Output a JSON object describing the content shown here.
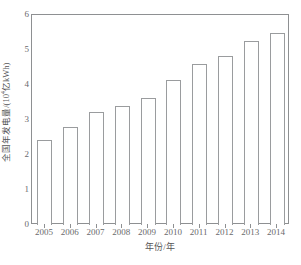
{
  "chart_data": {
    "type": "bar",
    "title": "",
    "subtitle": "",
    "xlabel": "年份/年",
    "ylabel": "全国年发电量/(10⁴亿kWh)",
    "ylabel_main": "全国年发电量/(10",
    "ylabel_sup": "4",
    "ylabel_tail": "亿kWh)",
    "categories": [
      "2005",
      "2006",
      "2007",
      "2008",
      "2009",
      "2010",
      "2011",
      "2012",
      "2013",
      "2014"
    ],
    "values": [
      2.43,
      2.8,
      3.22,
      3.4,
      3.63,
      4.14,
      4.6,
      4.83,
      5.26,
      5.49
    ],
    "ylim": [
      0,
      6
    ],
    "yticks": [
      "0",
      "1",
      "2",
      "3",
      "4",
      "5",
      "6"
    ],
    "ytick_values": [
      0,
      1,
      2,
      3,
      4,
      5,
      6
    ],
    "grid": false,
    "legend": null,
    "legend_position": "none",
    "bar_fill": "#ffffff",
    "bar_edge": "#9a9c9e",
    "axis_color": "#8e9092",
    "text_color": "#6a6a6c"
  }
}
